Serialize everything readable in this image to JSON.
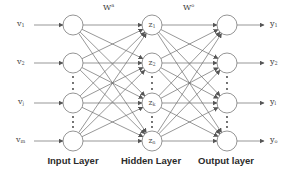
{
  "diagram": {
    "type": "neural-network",
    "colors": {
      "line": "#6b6b6b",
      "node_stroke": "#7a7a7a",
      "node_fill": "#ffffff",
      "text": "#444444",
      "title": "#2b2b2b"
    },
    "weights": {
      "input_hidden": {
        "base": "W",
        "sup": "a"
      },
      "hidden_output": {
        "base": "W",
        "sup": "o"
      }
    },
    "layers": {
      "input": {
        "title": "Input Layer",
        "labels": [
          {
            "base": "v",
            "sub": "1"
          },
          {
            "base": "v",
            "sub": "2"
          },
          {
            "base": "v",
            "sub": "j"
          },
          {
            "base": "v",
            "sub": "m"
          }
        ]
      },
      "hidden": {
        "title": "Hidden Layer",
        "labels": [
          {
            "base": "z",
            "sub": "1"
          },
          {
            "base": "z",
            "sub": "2"
          },
          {
            "base": "z",
            "sub": "k"
          },
          {
            "base": "z",
            "sub": "n"
          }
        ]
      },
      "output": {
        "title": "Output layer",
        "labels": [
          {
            "base": "y",
            "sub": "1"
          },
          {
            "base": "y",
            "sub": "2"
          },
          {
            "base": "y",
            "sub": "l"
          },
          {
            "base": "y",
            "sub": "o"
          }
        ]
      }
    },
    "ellipsis": "⋮"
  }
}
